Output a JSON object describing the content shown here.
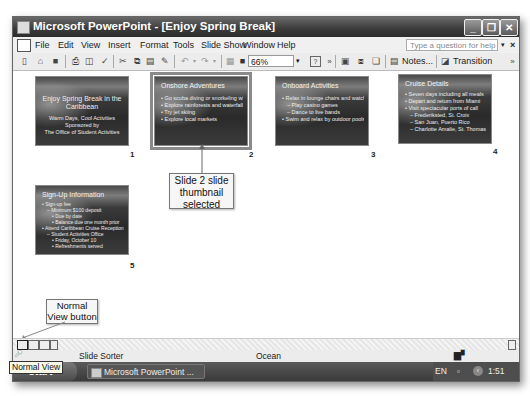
{
  "window": {
    "title": "Microsoft PowerPoint - [Enjoy Spring Break]",
    "controls": {
      "minimize": "_",
      "restore": "❐",
      "close": "✕"
    }
  },
  "menubar": {
    "items": [
      "File",
      "Edit",
      "View",
      "Insert",
      "Format",
      "Tools",
      "Slide Show",
      "Window",
      "Help"
    ],
    "help_placeholder": "Type a question for help",
    "close_doc": "×"
  },
  "toolbar": {
    "zoom_value": "66%",
    "notes_label": "Notes...",
    "transition_label": "Transition",
    "overflow": "»"
  },
  "slides": [
    {
      "number": "1",
      "title": "Enjoy Spring Break in the Caribbean",
      "lines": [
        "Warm Days, Cool Activities",
        "Sponsored by",
        "The Office of Student Activities"
      ]
    },
    {
      "number": "2",
      "title": "Onshore Adventures",
      "selected": true,
      "bullets": [
        "Go scuba diving or snorkeling with trained staff",
        "Explore rainforests and waterfalls",
        "Try jet skiing",
        "Explore local markets"
      ]
    },
    {
      "number": "3",
      "title": "Onboard Activities",
      "bullets": [
        "Relax in lounge chairs and watch shows",
        "Play casino games",
        "Dance to live bands",
        "Swim and relax by outdoor pools and whirlpools"
      ]
    },
    {
      "number": "4",
      "title": "Cruise Details",
      "bullets": [
        "Seven days including all meals",
        "Depart and return from Miami",
        "Visit spectacular ports of call",
        "Frederiksted, St. Croix",
        "San Juan, Puerto Rico",
        "Charlotte Amalie, St. Thomas"
      ]
    },
    {
      "number": "5",
      "title": "Sign-Up Information",
      "bullets": [
        "Sign-up fee",
        "Minimum $100 deposit",
        "Due by date",
        "Balance due one month prior",
        "Attend Caribbean Cruise Reception",
        "Student Activities Office",
        "Friday, October 10",
        "Refreshments served"
      ]
    }
  ],
  "callouts": {
    "selected_slide": "Slide 2 slide thumbnail selected",
    "normal_view": "Normal View button"
  },
  "statusbar": {
    "view": "Slide Sorter",
    "design": "Ocean"
  },
  "tooltip": "Normal View",
  "taskbar": {
    "start": "start",
    "task": "Microsoft PowerPoint ...",
    "language": "EN",
    "time": "1:51 PM"
  }
}
